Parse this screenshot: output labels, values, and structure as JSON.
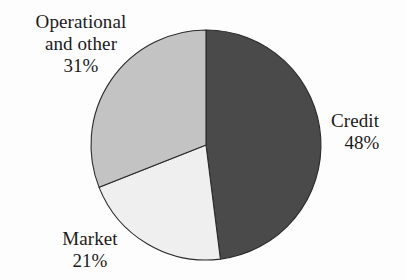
{
  "chart_data": {
    "type": "pie",
    "title": "",
    "subtitle": "",
    "xlabel": "",
    "ylabel": "",
    "grid": false,
    "legend_position": "none",
    "label_position": "outside",
    "start_angle_deg": 0,
    "direction": "clockwise",
    "units": "percent",
    "total": 100,
    "categories": [
      "Credit",
      "Market",
      "Operational and other"
    ],
    "values": [
      48,
      21,
      31
    ],
    "slices": [
      {
        "name": "Credit",
        "label": "Credit",
        "value": 48,
        "value_label": "48%",
        "color": "#4a4a4a",
        "start_deg": 0,
        "end_deg": 172.8
      },
      {
        "name": "Market",
        "label": "Market",
        "value": 21,
        "value_label": "21%",
        "color": "#efefef",
        "start_deg": 172.8,
        "end_deg": 248.4
      },
      {
        "name": "Operational and other",
        "label_line1": "Operational",
        "label_line2": "and other",
        "label": "Operational and other",
        "value": 31,
        "value_label": "31%",
        "color": "#c3c3c3",
        "start_deg": 248.4,
        "end_deg": 360
      }
    ],
    "colors": {
      "credit": "#4a4a4a",
      "market": "#efefef",
      "operational": "#c3c3c3",
      "outline": "#2b2b2b",
      "text": "#1a1a1a",
      "background": "#fdfdfd"
    }
  },
  "labels": {
    "operational": {
      "line1": "Operational",
      "line2": "and other",
      "value": "31%"
    },
    "credit": {
      "line1": "Credit",
      "value": "48%"
    },
    "market": {
      "line1": "Market",
      "value": "21%"
    }
  }
}
